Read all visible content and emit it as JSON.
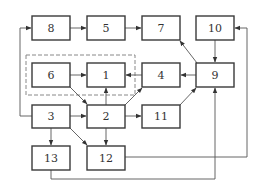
{
  "diagram": {
    "type": "block-flow-diagram",
    "colors": {
      "stroke": "#3a3a3a",
      "line": "#555555",
      "dashed": "#888888",
      "text": "#333333",
      "background": "#ffffff"
    },
    "nodes": [
      {
        "id": "n8",
        "label": "8",
        "x": 32,
        "y": 16,
        "w": 38,
        "h": 24
      },
      {
        "id": "n5",
        "label": "5",
        "x": 87,
        "y": 16,
        "w": 38,
        "h": 24
      },
      {
        "id": "n7",
        "label": "7",
        "x": 142,
        "y": 16,
        "w": 38,
        "h": 24
      },
      {
        "id": "n10",
        "label": "10",
        "x": 196,
        "y": 16,
        "w": 38,
        "h": 24
      },
      {
        "id": "n6",
        "label": "6",
        "x": 32,
        "y": 63,
        "w": 38,
        "h": 24
      },
      {
        "id": "n1",
        "label": "1",
        "x": 87,
        "y": 63,
        "w": 38,
        "h": 24
      },
      {
        "id": "n4",
        "label": "4",
        "x": 142,
        "y": 63,
        "w": 38,
        "h": 24
      },
      {
        "id": "n9",
        "label": "9",
        "x": 196,
        "y": 63,
        "w": 38,
        "h": 24
      },
      {
        "id": "n3",
        "label": "3",
        "x": 32,
        "y": 105,
        "w": 38,
        "h": 23
      },
      {
        "id": "n2",
        "label": "2",
        "x": 87,
        "y": 105,
        "w": 38,
        "h": 23
      },
      {
        "id": "n11",
        "label": "11",
        "x": 142,
        "y": 105,
        "w": 38,
        "h": 23
      },
      {
        "id": "n13",
        "label": "13",
        "x": 32,
        "y": 146,
        "w": 38,
        "h": 24
      },
      {
        "id": "n12",
        "label": "12",
        "x": 87,
        "y": 146,
        "w": 38,
        "h": 24
      }
    ],
    "group": {
      "id": "dashed-group",
      "members": [
        "6",
        "1"
      ],
      "x": 26,
      "y": 55,
      "w": 109,
      "h": 40
    },
    "edges": [
      {
        "from": "8",
        "to": "5"
      },
      {
        "from": "5",
        "to": "7"
      },
      {
        "from": "9",
        "to": "7"
      },
      {
        "from": "10",
        "to": "9"
      },
      {
        "from": "6",
        "to": "1"
      },
      {
        "from": "4",
        "to": "1"
      },
      {
        "from": "9",
        "to": "4"
      },
      {
        "from": "6",
        "to": "2"
      },
      {
        "from": "2",
        "to": "1"
      },
      {
        "from": "2",
        "to": "4"
      },
      {
        "from": "3",
        "to": "2"
      },
      {
        "from": "2",
        "to": "11"
      },
      {
        "from": "11",
        "to": "9"
      },
      {
        "from": "3",
        "to": "13"
      },
      {
        "from": "3",
        "to": "12"
      },
      {
        "from": "2",
        "to": "12"
      },
      {
        "from": "3",
        "to": "8"
      },
      {
        "from": "12",
        "to": "10"
      },
      {
        "from": "13",
        "to": "9"
      }
    ]
  }
}
